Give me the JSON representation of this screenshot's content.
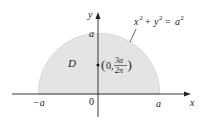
{
  "figure": {
    "region_label": "D",
    "equation": {
      "x_var": "x",
      "y_var": "y",
      "exp": "2",
      "plus": "+",
      "equals": "=",
      "rhs_var": "a",
      "rhs_exp": "2"
    },
    "centroid": {
      "open": "(",
      "x": "0,",
      "numerator": "3a",
      "denominator": "2π",
      "close": ")"
    },
    "axes": {
      "x_label": "x",
      "y_label": "y",
      "origin_label": "0",
      "neg_a_label": "−a",
      "pos_a_label": "a",
      "top_a_label": "a"
    },
    "colors": {
      "fill": "#e4e4e4",
      "stroke": "#222222"
    }
  }
}
